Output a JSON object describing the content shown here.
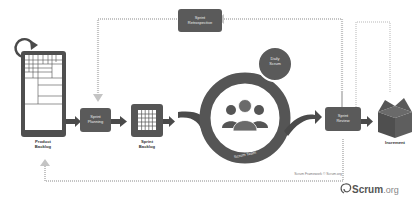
{
  "diagram": {
    "title": "Scrum Framework",
    "nodes": {
      "product_backlog": {
        "line1": "Product",
        "line2": "Backlog"
      },
      "sprint_planning": {
        "line1": "Sprint",
        "line2": "Planning"
      },
      "sprint_backlog": {
        "line1": "Sprint",
        "line2": "Backlog"
      },
      "sprint_retrospective": {
        "line1": "Sprint",
        "line2": "Retrospective"
      },
      "daily_scrum": {
        "line1": "Daily",
        "line2": "Scrum"
      },
      "scrum_team": {
        "label": "Scrum Team"
      },
      "sprint_review": {
        "line1": "Sprint",
        "line2": "Review"
      },
      "increment": {
        "label": "Increment"
      }
    },
    "copyright": "Scrum Framework © Scrum.org",
    "brand": {
      "name": "Scrum",
      "suffix": ".org"
    },
    "colors": {
      "dark": "#5a5a5a",
      "arrow": "#4a4a4a",
      "dotted": "#bdbdbd",
      "text": "#333333"
    }
  }
}
